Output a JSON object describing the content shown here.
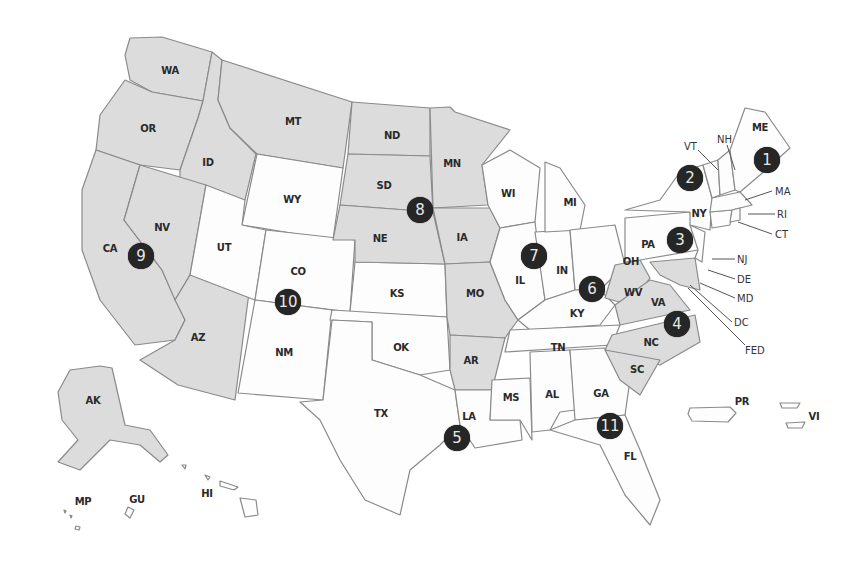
{
  "map": {
    "title": "",
    "type": "US federal judicial circuits map",
    "colors": {
      "shaded_state": "#dcdcdc",
      "plain_state": "#fdfdfd",
      "border": "#8a8a8a",
      "marker_fill": "#262626",
      "marker_text": "#e8e8e8"
    },
    "state_labels": [
      {
        "code": "WA",
        "x": 170,
        "y": 70
      },
      {
        "code": "OR",
        "x": 148,
        "y": 128
      },
      {
        "code": "ID",
        "x": 208,
        "y": 162
      },
      {
        "code": "MT",
        "x": 293,
        "y": 121
      },
      {
        "code": "ND",
        "x": 392,
        "y": 135
      },
      {
        "code": "MN",
        "x": 452,
        "y": 163
      },
      {
        "code": "SD",
        "x": 384,
        "y": 185
      },
      {
        "code": "WY",
        "x": 292,
        "y": 199
      },
      {
        "code": "NE",
        "x": 380,
        "y": 238
      },
      {
        "code": "IA",
        "x": 462,
        "y": 237
      },
      {
        "code": "WI",
        "x": 508,
        "y": 193
      },
      {
        "code": "MI",
        "x": 570,
        "y": 202
      },
      {
        "code": "NV",
        "x": 162,
        "y": 227
      },
      {
        "code": "CA",
        "x": 110,
        "y": 248
      },
      {
        "code": "UT",
        "x": 224,
        "y": 247
      },
      {
        "code": "CO",
        "x": 298,
        "y": 271
      },
      {
        "code": "KS",
        "x": 397,
        "y": 293
      },
      {
        "code": "MO",
        "x": 475,
        "y": 293
      },
      {
        "code": "IL",
        "x": 520,
        "y": 280
      },
      {
        "code": "IN",
        "x": 562,
        "y": 270
      },
      {
        "code": "OH",
        "x": 631,
        "y": 261
      },
      {
        "code": "PA",
        "x": 648,
        "y": 244
      },
      {
        "code": "NY",
        "x": 699,
        "y": 213
      },
      {
        "code": "KY",
        "x": 577,
        "y": 313
      },
      {
        "code": "WV",
        "x": 633,
        "y": 292
      },
      {
        "code": "VA",
        "x": 658,
        "y": 302
      },
      {
        "code": "AZ",
        "x": 198,
        "y": 337
      },
      {
        "code": "NM",
        "x": 284,
        "y": 352
      },
      {
        "code": "OK",
        "x": 401,
        "y": 347
      },
      {
        "code": "AR",
        "x": 471,
        "y": 360
      },
      {
        "code": "TN",
        "x": 558,
        "y": 347
      },
      {
        "code": "NC",
        "x": 651,
        "y": 342
      },
      {
        "code": "SC",
        "x": 637,
        "y": 369
      },
      {
        "code": "TX",
        "x": 381,
        "y": 413
      },
      {
        "code": "MS",
        "x": 511,
        "y": 397
      },
      {
        "code": "AL",
        "x": 552,
        "y": 394
      },
      {
        "code": "GA",
        "x": 601,
        "y": 393
      },
      {
        "code": "LA",
        "x": 469,
        "y": 416
      },
      {
        "code": "FL",
        "x": 630,
        "y": 456
      },
      {
        "code": "ME",
        "x": 760,
        "y": 127
      },
      {
        "code": "AK",
        "x": 93,
        "y": 400
      },
      {
        "code": "HI",
        "x": 207,
        "y": 493
      },
      {
        "code": "GU",
        "x": 137,
        "y": 499
      },
      {
        "code": "MP",
        "x": 83,
        "y": 501
      },
      {
        "code": "PR",
        "x": 742,
        "y": 401
      },
      {
        "code": "VI",
        "x": 814,
        "y": 416
      }
    ],
    "callouts": [
      {
        "code": "VT",
        "x": 684,
        "y": 146
      },
      {
        "code": "NH",
        "x": 717,
        "y": 139
      },
      {
        "code": "MA",
        "x": 775,
        "y": 191
      },
      {
        "code": "RI",
        "x": 777,
        "y": 214
      },
      {
        "code": "CT",
        "x": 775,
        "y": 234
      },
      {
        "code": "NJ",
        "x": 737,
        "y": 259
      },
      {
        "code": "DE",
        "x": 737,
        "y": 279
      },
      {
        "code": "MD",
        "x": 737,
        "y": 298
      },
      {
        "code": "DC",
        "x": 734,
        "y": 322
      },
      {
        "code": "FED",
        "x": 745,
        "y": 350
      }
    ],
    "circuit_markers": [
      {
        "number": "1",
        "x": 767,
        "y": 160
      },
      {
        "number": "2",
        "x": 690,
        "y": 178
      },
      {
        "number": "3",
        "x": 680,
        "y": 240
      },
      {
        "number": "4",
        "x": 677,
        "y": 324
      },
      {
        "number": "5",
        "x": 457,
        "y": 438
      },
      {
        "number": "6",
        "x": 592,
        "y": 289
      },
      {
        "number": "7",
        "x": 534,
        "y": 256
      },
      {
        "number": "8",
        "x": 420,
        "y": 210
      },
      {
        "number": "9",
        "x": 141,
        "y": 256
      },
      {
        "number": "10",
        "x": 288,
        "y": 302
      },
      {
        "number": "11",
        "x": 610,
        "y": 426
      }
    ]
  }
}
